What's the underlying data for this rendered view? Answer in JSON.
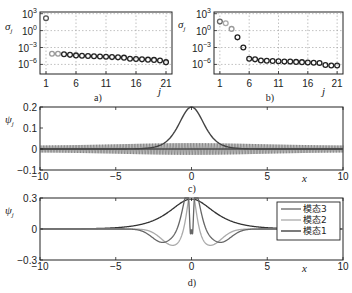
{
  "figure": {
    "panels": [
      {
        "id": "a",
        "caption": "a)"
      },
      {
        "id": "b",
        "caption": "b)"
      },
      {
        "id": "c",
        "caption": "c)"
      },
      {
        "id": "d",
        "caption": "d)"
      }
    ]
  },
  "chart_data": [
    {
      "panel": "a",
      "type": "scatter",
      "title": "",
      "caption": "a)",
      "xlabel": "j",
      "ylabel": "σ_j",
      "yscale": "log",
      "xticks": [
        "1",
        "6",
        "11",
        "16",
        "21"
      ],
      "yticks": [
        "10^3",
        "10^0",
        "10^-3",
        "10^-6"
      ],
      "xlim": [
        0,
        22
      ],
      "ylim_log10": [
        3.3,
        -7.7
      ],
      "grid": true,
      "x": [
        1,
        2,
        3,
        4,
        5,
        6,
        7,
        8,
        9,
        10,
        11,
        12,
        13,
        14,
        15,
        16,
        17,
        18,
        19,
        20,
        21
      ],
      "log10_values": [
        2.2,
        -4.1,
        -4.1,
        -4.2,
        -4.3,
        -4.4,
        -4.45,
        -4.5,
        -4.55,
        -4.6,
        -4.65,
        -4.7,
        -4.75,
        -4.8,
        -5.0,
        -5.05,
        -5.1,
        -5.15,
        -5.2,
        -5.3,
        -5.6
      ],
      "marker_colors": [
        "#555555",
        "#999999",
        "#999999",
        "#222222",
        "#222222",
        "#222222",
        "#222222",
        "#222222",
        "#222222",
        "#222222",
        "#222222",
        "#222222",
        "#222222",
        "#222222",
        "#222222",
        "#222222",
        "#222222",
        "#222222",
        "#222222",
        "#222222",
        "#222222"
      ]
    },
    {
      "panel": "b",
      "type": "scatter",
      "title": "",
      "caption": "b)",
      "xlabel": "j",
      "ylabel": "σ_j",
      "yscale": "log",
      "xticks": [
        "1",
        "6",
        "11",
        "16",
        "21"
      ],
      "yticks": [
        "10^3",
        "10^0",
        "10^-3",
        "10^-6"
      ],
      "xlim": [
        0,
        22
      ],
      "ylim_log10": [
        3.3,
        -7.7
      ],
      "grid": true,
      "x": [
        1,
        2,
        3,
        4,
        5,
        6,
        7,
        8,
        9,
        10,
        11,
        12,
        13,
        14,
        15,
        16,
        17,
        18,
        19,
        20,
        21
      ],
      "log10_values": [
        1.6,
        1.3,
        0.3,
        -1.2,
        -3.0,
        -5.0,
        -5.1,
        -5.3,
        -5.35,
        -5.4,
        -5.45,
        -5.5,
        -5.5,
        -5.55,
        -5.6,
        -5.65,
        -5.7,
        -5.75,
        -6.1,
        -6.2,
        -6.2
      ],
      "marker_colors": [
        "#666666",
        "#aaaaaa",
        "#999999",
        "#222222",
        "#222222",
        "#222222",
        "#222222",
        "#222222",
        "#222222",
        "#222222",
        "#222222",
        "#222222",
        "#222222",
        "#222222",
        "#222222",
        "#222222",
        "#222222",
        "#222222",
        "#222222",
        "#222222",
        "#222222"
      ]
    },
    {
      "panel": "c",
      "type": "line",
      "title": "",
      "caption": "c)",
      "xlabel": "x",
      "ylabel": "ψ_j",
      "xticks": [
        "−10",
        "−5",
        "0",
        "5",
        "10"
      ],
      "yticks": [
        "0.2",
        "0.1",
        "0",
        "−0.1"
      ],
      "xlim": [
        -10,
        10
      ],
      "ylim": [
        -0.1,
        0.2
      ],
      "grid": false,
      "series": [
        {
          "name": "mode (sech-like peak)",
          "color": "#444444",
          "description": "smooth peak, max 0.2 at x=0, decays to ~0 by |x|≈5"
        },
        {
          "name": "oscillatory modes",
          "color": "#888888",
          "description": "rapid oscillations, envelope ≈ ±0.02 at edges to ±0.035 near center"
        }
      ]
    },
    {
      "panel": "d",
      "type": "line",
      "title": "",
      "caption": "d)",
      "xlabel": "x",
      "ylabel": "ψ_j",
      "xticks": [
        "−10",
        "−5",
        "0",
        "5",
        "10"
      ],
      "yticks": [
        "0.3",
        "0",
        "−0.3"
      ],
      "xlim": [
        -10,
        10
      ],
      "ylim": [
        -0.3,
        0.3
      ],
      "grid": false,
      "legend": {
        "position": "upper right",
        "entries": [
          "模态3",
          "模态2",
          "模态1"
        ]
      },
      "series": [
        {
          "name": "模态3",
          "color": "#666666",
          "description": "peak 0.28 at 0 with side shoulders ±0.2 near |x|≈0.6, deep dip −0.28 at center region edges, minima −0.1 near |x|≈2"
        },
        {
          "name": "模态2",
          "color": "#aaaaaa",
          "description": "central peak ~0.24 at 0, negative lobes −0.15 near |x|≈1.2"
        },
        {
          "name": "模态1",
          "color": "#333333",
          "description": "smooth peak ~0.3 at x=0, decays to 0 by |x|≈6"
        }
      ]
    }
  ]
}
